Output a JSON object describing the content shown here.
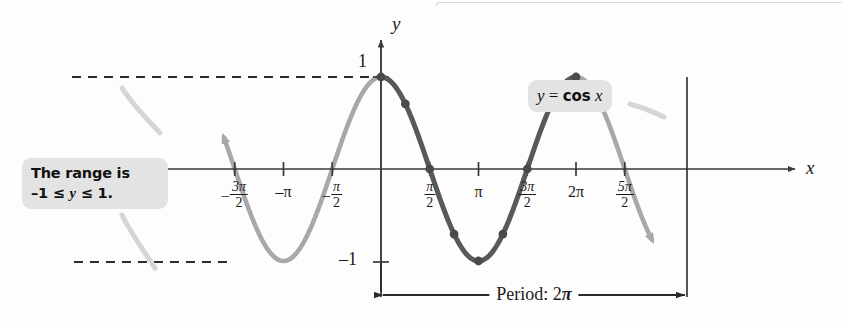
{
  "figure": {
    "background_color": "#fdfdfd",
    "curve_color_highlight": "#595959",
    "curve_color_light": "#a8a8a8",
    "axis_color": "#3a3a3a",
    "callout_bg": "#e3e3e3"
  },
  "axes": {
    "x_axis_label": "x",
    "y_axis_label": "y",
    "y_tick_top": "1",
    "y_tick_bottom": "–1",
    "x_ticks": [
      {
        "label_lead": "–",
        "num": "3π",
        "den": "2",
        "plain": null,
        "x_value": -4.712388
      },
      {
        "label_lead": null,
        "num": null,
        "den": null,
        "plain": "–π",
        "x_value": -3.141593
      },
      {
        "label_lead": "–",
        "num": "π",
        "den": "2",
        "plain": null,
        "x_value": -1.570796
      },
      {
        "label_lead": null,
        "num": "π",
        "den": "2",
        "plain": null,
        "x_value": 1.570796
      },
      {
        "label_lead": null,
        "num": null,
        "den": null,
        "plain": "π",
        "x_value": 3.141593
      },
      {
        "label_lead": null,
        "num": "3π",
        "den": "2",
        "plain": null,
        "x_value": 4.712388
      },
      {
        "label_lead": null,
        "num": null,
        "den": null,
        "plain": "2π",
        "x_value": 6.283185
      },
      {
        "label_lead": null,
        "num": "5π",
        "den": "2",
        "plain": null,
        "x_value": 7.853982
      }
    ]
  },
  "callouts": {
    "range": {
      "line1": "The range is",
      "line2_pre": "–1 ≤ ",
      "line2_var": "y",
      "line2_post": " ≤ 1."
    },
    "equation": {
      "lhs": "y",
      "eq": " = ",
      "fn": "cos",
      "arg": " x"
    }
  },
  "annotations": {
    "period_text": "Period: 2",
    "period_pi": "π"
  },
  "chart_data": {
    "type": "line",
    "title": "y = cos x",
    "xlabel": "x",
    "ylabel": "y",
    "xlim": [
      -5.5,
      8.6
    ],
    "ylim": [
      -1.35,
      1.35
    ],
    "grid": false,
    "legend": "none",
    "function": "y = cos(x)",
    "period": 6.283185,
    "amplitude": 1,
    "range_description": "-1 <= y <= 1",
    "x_tick_values": [
      -4.712388,
      -3.141593,
      -1.570796,
      1.570796,
      3.141593,
      4.712388,
      6.283185,
      7.853982
    ],
    "x_tick_labels": [
      "-3π/2",
      "-π",
      "-π/2",
      "π/2",
      "π",
      "3π/2",
      "2π",
      "5π/2"
    ],
    "y_tick_values": [
      1,
      -1
    ],
    "y_tick_labels": [
      "1",
      "-1"
    ],
    "reference_lines": [
      {
        "type": "horizontal",
        "y": 1,
        "style": "dashed"
      },
      {
        "type": "horizontal",
        "y": -1,
        "style": "dashed"
      }
    ],
    "highlighted_interval": [
      0,
      6.283185
    ],
    "marked_points": [
      {
        "x": 0.0,
        "y": 1.0,
        "label": "0, 1"
      },
      {
        "x": 0.785398,
        "y": 0.7071,
        "label": "π/4, 0.707"
      },
      {
        "x": 1.570796,
        "y": 0.0,
        "label": "π/2, 0"
      },
      {
        "x": 2.356194,
        "y": -0.7071,
        "label": "3π/4, -0.707"
      },
      {
        "x": 3.141593,
        "y": -1.0,
        "label": "π, -1"
      },
      {
        "x": 3.926991,
        "y": -0.7071,
        "label": "5π/4, -0.707"
      },
      {
        "x": 4.712389,
        "y": 0.0,
        "label": "3π/2, 0"
      },
      {
        "x": 5.497787,
        "y": 0.7071,
        "label": "7π/4, 0.707"
      },
      {
        "x": 6.283185,
        "y": 1.0,
        "label": "2π, 1"
      }
    ]
  }
}
